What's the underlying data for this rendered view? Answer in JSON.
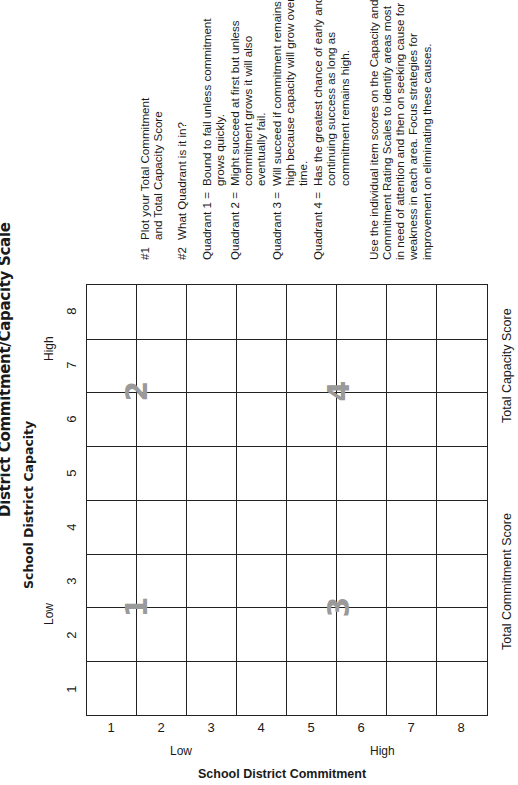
{
  "title": "District Commitment/Capacity Scale",
  "chart": {
    "x_axis_title": "School District Capacity",
    "x_low": "Low",
    "x_high": "High",
    "x_ticks": [
      "1",
      "2",
      "3",
      "4",
      "5",
      "6",
      "7",
      "8"
    ],
    "y_axis_title": "School District Commitment",
    "y_low": "Low",
    "y_high": "High",
    "y_ticks": [
      "1",
      "2",
      "3",
      "4",
      "5",
      "6",
      "7",
      "8"
    ],
    "quadrant_labels": [
      "1",
      "2",
      "3",
      "4"
    ],
    "total_commitment_label": "Total Commitment Score",
    "total_capacity_label": "Total Capacity Score"
  },
  "instructions": {
    "step1_num": "#1",
    "step1_line1": "Plot your Total Commitment",
    "step1_line2": "and Total Capacity Score",
    "step2_num": "#2",
    "step2_text": "What Quadrant is it in?",
    "quadrants": [
      {
        "label": "Quadrant 1 =",
        "text": "Bound to fail unless commitment grows quickly."
      },
      {
        "label": "Quadrant 2 =",
        "text": "Might succeed at first but unless commitment grows it will also eventually fail."
      },
      {
        "label": "Quadrant 3 =",
        "text": "Will succeed if commitment remains high because capacity will grow over time."
      },
      {
        "label": "Quadrant 4 =",
        "text": "Has the greatest chance of early and continuing success as long as commitment remains high."
      }
    ],
    "note": "Use the individual item scores on the Capacity and Commitment Rating Scales to identify areas most in need of attention and then on seeking cause for weakness in each area. Focus strategies for improvement on eliminating these causes."
  },
  "colors": {
    "grid_line": "#222222",
    "quadrant_number": "#9a9a9a",
    "text": "#1a1a1a"
  }
}
